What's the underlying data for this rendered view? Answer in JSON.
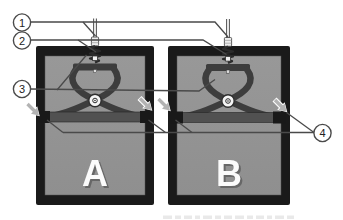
{
  "figure": {
    "panels": [
      {
        "label": "A"
      },
      {
        "label": "B"
      }
    ],
    "callouts": [
      {
        "number": "1"
      },
      {
        "number": "2"
      },
      {
        "number": "3"
      },
      {
        "number": "4"
      }
    ],
    "icons": [
      {
        "name": "cursor-arrow-icon",
        "shape": "small light-gray arrow pointing down-right at crossbar ends",
        "count": 4
      }
    ],
    "colors": {
      "background": "#ffffff",
      "panel_frame": "#1a1a1a",
      "panel_fill": "#8f8f8f",
      "panel_fill_light": "#989898",
      "mech": "#3d3d3d",
      "bar": "#515151",
      "clamp": "#191919",
      "leader": "#4a4a4a",
      "arrow": "#b3b3b3",
      "callout_fill": "#ffffff",
      "callout_stroke": "#4a4a4a",
      "callout_text": "#222222",
      "panel_label": "#fbfbfb",
      "caption_faint": "#e9e9e9"
    }
  }
}
